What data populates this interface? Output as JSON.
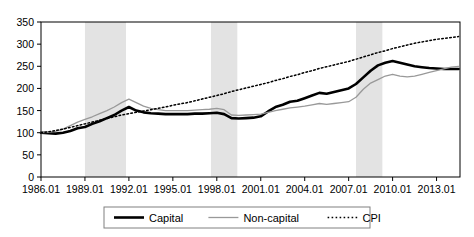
{
  "chart_data": {
    "type": "line",
    "title": "",
    "xlabel": "",
    "ylabel": "",
    "ylim": [
      0,
      350
    ],
    "ytick_step": 50,
    "yticks": [
      "0",
      "50",
      "100",
      "150",
      "200",
      "250",
      "300",
      "350"
    ],
    "xticks": [
      "1986.01",
      "1989.01",
      "1992.01",
      "1995.01",
      "1998.01",
      "2001.01",
      "2004.01",
      "2007.01",
      "2010.01",
      "2013.01"
    ],
    "xlim": [
      1986.0,
      2014.6
    ],
    "grid": false,
    "legend_position": "bottom-center",
    "shaded_bands_label": "recession-shading",
    "shaded_band_color": "#e3e3e3",
    "shaded_bands": [
      {
        "start": 1989.0,
        "end": 1991.8
      },
      {
        "start": 1997.6,
        "end": 1999.4
      },
      {
        "start": 2007.5,
        "end": 2009.3
      }
    ],
    "series": [
      {
        "name": "Capital",
        "style": "solid-thick",
        "color": "#000000",
        "x": [
          1986.0,
          1986.5,
          1987.0,
          1987.5,
          1988.0,
          1988.5,
          1989.0,
          1989.5,
          1990.0,
          1990.5,
          1991.0,
          1991.5,
          1992.0,
          1992.5,
          1993.0,
          1993.5,
          1994.0,
          1994.5,
          1995.0,
          1995.5,
          1996.0,
          1996.5,
          1997.0,
          1997.5,
          1998.0,
          1998.5,
          1999.0,
          1999.5,
          2000.0,
          2000.5,
          2001.0,
          2001.5,
          2002.0,
          2002.5,
          2003.0,
          2003.5,
          2004.0,
          2004.5,
          2005.0,
          2005.5,
          2006.0,
          2006.5,
          2007.0,
          2007.5,
          2008.0,
          2008.5,
          2009.0,
          2009.5,
          2010.0,
          2010.5,
          2011.0,
          2011.5,
          2012.0,
          2012.5,
          2013.0,
          2013.5,
          2014.0,
          2014.5
        ],
        "values": [
          100,
          99,
          98,
          100,
          104,
          110,
          113,
          120,
          126,
          133,
          140,
          150,
          158,
          150,
          146,
          144,
          143,
          142,
          142,
          142,
          142,
          143,
          143,
          144,
          145,
          142,
          133,
          132,
          133,
          134,
          137,
          148,
          158,
          163,
          170,
          172,
          178,
          184,
          190,
          188,
          192,
          196,
          200,
          210,
          225,
          240,
          252,
          258,
          262,
          258,
          254,
          250,
          248,
          246,
          245,
          244,
          244,
          244
        ]
      },
      {
        "name": "Non-capital",
        "style": "solid-thin",
        "color": "#999999",
        "x": [
          1986.0,
          1986.5,
          1987.0,
          1987.5,
          1988.0,
          1988.5,
          1989.0,
          1989.5,
          1990.0,
          1990.5,
          1991.0,
          1991.5,
          1992.0,
          1992.5,
          1993.0,
          1993.5,
          1994.0,
          1994.5,
          1995.0,
          1995.5,
          1996.0,
          1996.5,
          1997.0,
          1997.5,
          1998.0,
          1998.5,
          1999.0,
          1999.5,
          2000.0,
          2000.5,
          2001.0,
          2001.5,
          2002.0,
          2002.5,
          2003.0,
          2003.5,
          2004.0,
          2004.5,
          2005.0,
          2005.5,
          2006.0,
          2006.5,
          2007.0,
          2007.5,
          2008.0,
          2008.5,
          2009.0,
          2009.5,
          2010.0,
          2010.5,
          2011.0,
          2011.5,
          2012.0,
          2012.5,
          2013.0,
          2013.5,
          2014.0,
          2014.5
        ],
        "values": [
          100,
          101,
          103,
          108,
          116,
          124,
          130,
          136,
          143,
          150,
          158,
          168,
          176,
          168,
          160,
          155,
          152,
          150,
          150,
          150,
          150,
          151,
          152,
          153,
          155,
          152,
          140,
          139,
          140,
          141,
          142,
          146,
          150,
          153,
          156,
          158,
          160,
          163,
          166,
          164,
          166,
          168,
          170,
          180,
          198,
          212,
          220,
          228,
          232,
          228,
          226,
          228,
          232,
          236,
          240,
          244,
          248,
          250
        ]
      },
      {
        "name": "CPI",
        "style": "dotted",
        "color": "#000000",
        "x": [
          1986.0,
          1986.5,
          1987.0,
          1987.5,
          1988.0,
          1988.5,
          1989.0,
          1989.5,
          1990.0,
          1990.5,
          1991.0,
          1991.5,
          1992.0,
          1992.5,
          1993.0,
          1993.5,
          1994.0,
          1994.5,
          1995.0,
          1995.5,
          1996.0,
          1996.5,
          1997.0,
          1997.5,
          1998.0,
          1998.5,
          1999.0,
          1999.5,
          2000.0,
          2000.5,
          2001.0,
          2001.5,
          2002.0,
          2002.5,
          2003.0,
          2003.5,
          2004.0,
          2004.5,
          2005.0,
          2005.5,
          2006.0,
          2006.5,
          2007.0,
          2007.5,
          2008.0,
          2008.5,
          2009.0,
          2009.5,
          2010.0,
          2010.5,
          2011.0,
          2011.5,
          2012.0,
          2012.5,
          2013.0,
          2013.5,
          2014.0,
          2014.5
        ],
        "values": [
          100,
          102,
          105,
          108,
          112,
          116,
          120,
          124,
          128,
          132,
          136,
          140,
          143,
          146,
          149,
          152,
          155,
          158,
          162,
          165,
          168,
          172,
          176,
          180,
          184,
          188,
          193,
          197,
          201,
          205,
          209,
          213,
          218,
          222,
          227,
          231,
          236,
          240,
          245,
          249,
          253,
          257,
          261,
          266,
          271,
          276,
          281,
          285,
          290,
          294,
          298,
          302,
          305,
          308,
          311,
          313,
          315,
          317
        ]
      }
    ],
    "legend": [
      {
        "label": "Capital",
        "style": "solid-thick"
      },
      {
        "label": "Non-capital",
        "style": "solid-thin"
      },
      {
        "label": "CPI",
        "style": "dotted"
      }
    ]
  }
}
